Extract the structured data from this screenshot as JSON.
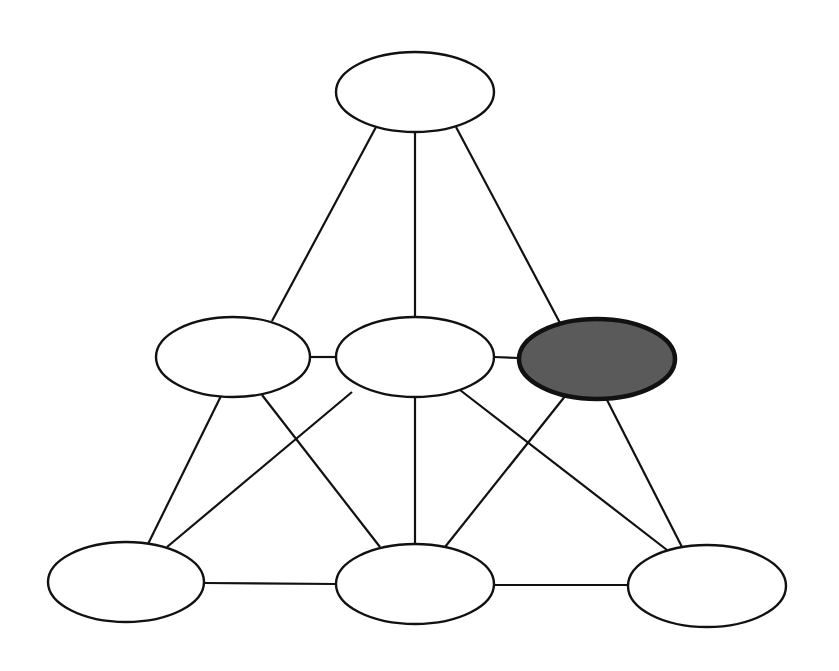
{
  "diagram": {
    "type": "network-graph",
    "background": "#ffffff",
    "stroke_color": "#111111",
    "highlight_fill": "#5a5a5a",
    "node_fill": "#ffffff",
    "nodes": [
      {
        "id": "top",
        "cx": 415,
        "cy": 92,
        "rx": 79,
        "ry": 40,
        "highlighted": false
      },
      {
        "id": "mid-left",
        "cx": 233,
        "cy": 357,
        "rx": 77,
        "ry": 40,
        "highlighted": false
      },
      {
        "id": "mid-center",
        "cx": 415,
        "cy": 357,
        "rx": 79,
        "ry": 40,
        "highlighted": false
      },
      {
        "id": "mid-right",
        "cx": 597,
        "cy": 359,
        "rx": 78,
        "ry": 40,
        "highlighted": true
      },
      {
        "id": "bottom-left",
        "cx": 126,
        "cy": 582,
        "rx": 78,
        "ry": 40,
        "highlighted": false
      },
      {
        "id": "bottom-center",
        "cx": 415,
        "cy": 584,
        "rx": 79,
        "ry": 40,
        "highlighted": false
      },
      {
        "id": "bottom-right",
        "cx": 707,
        "cy": 586,
        "rx": 79,
        "ry": 41,
        "highlighted": false
      }
    ],
    "edges": [
      {
        "from": "top",
        "to": "mid-left",
        "x1": 376,
        "y1": 127,
        "x2": 272,
        "y2": 321
      },
      {
        "from": "top",
        "to": "mid-center",
        "x1": 415,
        "y1": 132,
        "x2": 415,
        "y2": 317
      },
      {
        "from": "top",
        "to": "mid-right",
        "x1": 456,
        "y1": 127,
        "x2": 560,
        "y2": 323
      },
      {
        "from": "mid-left",
        "to": "mid-center",
        "x1": 310,
        "y1": 357,
        "x2": 336,
        "y2": 357
      },
      {
        "from": "mid-center",
        "to": "mid-right",
        "x1": 494,
        "y1": 357,
        "x2": 519,
        "y2": 358
      },
      {
        "from": "mid-left",
        "to": "bottom-left",
        "x1": 221,
        "y1": 396,
        "x2": 148,
        "y2": 544
      },
      {
        "from": "mid-left",
        "to": "bottom-center",
        "x1": 262,
        "y1": 395,
        "x2": 380,
        "y2": 547
      },
      {
        "from": "mid-center",
        "to": "bottom-left",
        "x1": 352,
        "y1": 392,
        "x2": 167,
        "y2": 547
      },
      {
        "from": "mid-center",
        "to": "bottom-center",
        "x1": 415,
        "y1": 397,
        "x2": 415,
        "y2": 544
      },
      {
        "from": "mid-center",
        "to": "bottom-right",
        "x1": 460,
        "y1": 390,
        "x2": 667,
        "y2": 550
      },
      {
        "from": "mid-right",
        "to": "bottom-center",
        "x1": 566,
        "y1": 395,
        "x2": 445,
        "y2": 547
      },
      {
        "from": "mid-right",
        "to": "bottom-right",
        "x1": 606,
        "y1": 398,
        "x2": 682,
        "y2": 547
      },
      {
        "from": "bottom-left",
        "to": "bottom-center",
        "x1": 204,
        "y1": 583,
        "x2": 336,
        "y2": 584
      },
      {
        "from": "bottom-center",
        "to": "bottom-right",
        "x1": 494,
        "y1": 585,
        "x2": 628,
        "y2": 585
      }
    ]
  }
}
